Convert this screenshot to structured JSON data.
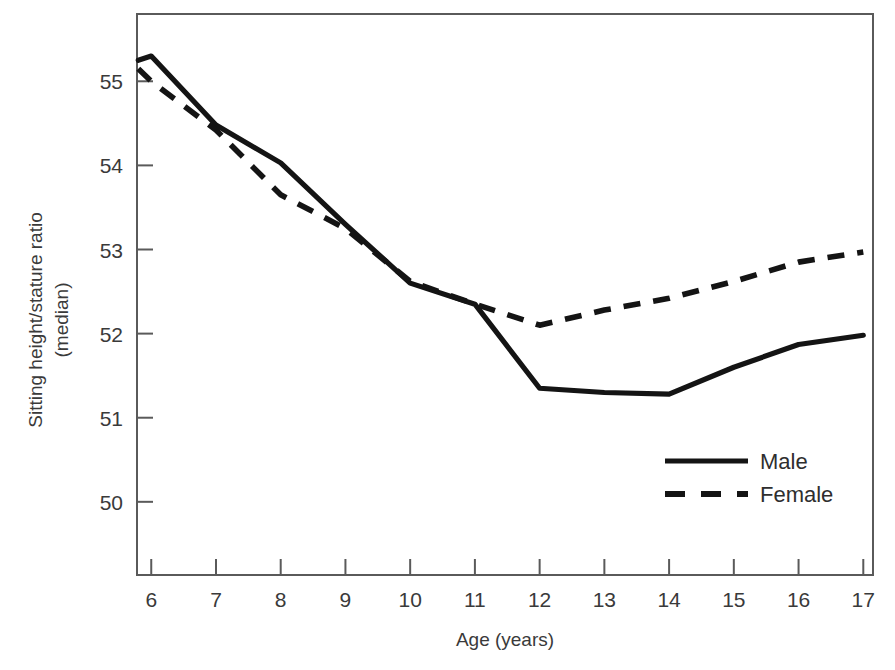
{
  "chart_data": {
    "type": "line",
    "title": "",
    "subtitle": "",
    "xlabel": "Age (years)",
    "ylabel_line1": "Sitting height/stature ratio",
    "ylabel_line2": "(median)",
    "x": [
      6,
      7,
      8,
      9,
      10,
      11,
      12,
      13,
      14,
      15,
      16,
      17
    ],
    "xticklabels": [
      "6",
      "7",
      "8",
      "9",
      "10",
      "11",
      "12",
      "13",
      "14",
      "15",
      "16",
      "17"
    ],
    "yticks": [
      50,
      51,
      52,
      53,
      54,
      55
    ],
    "yticklabels": [
      "50",
      "51",
      "52",
      "53",
      "54",
      "55"
    ],
    "xlim": [
      5.78,
      17.15
    ],
    "ylim": [
      49.13,
      55.8
    ],
    "grid": false,
    "legend_position": "lower right",
    "series": [
      {
        "name": "Male",
        "style": "solid",
        "color": "#141414",
        "x": [
          5.8,
          6.0,
          7.0,
          8.0,
          9.0,
          10.0,
          11.0,
          12.0,
          13.0,
          14.0,
          15.0,
          16.0,
          17.0
        ],
        "values": [
          55.25,
          55.3,
          54.48,
          54.03,
          53.3,
          52.6,
          52.35,
          51.35,
          51.3,
          51.28,
          51.6,
          51.87,
          51.98
        ]
      },
      {
        "name": "Female",
        "style": "dashed",
        "color": "#141414",
        "x": [
          5.8,
          6.0,
          7.0,
          8.0,
          9.0,
          10.0,
          11.0,
          12.0,
          13.0,
          14.0,
          15.0,
          16.0,
          17.0
        ],
        "values": [
          55.15,
          55.0,
          54.42,
          53.65,
          53.25,
          52.62,
          52.35,
          52.1,
          52.28,
          52.42,
          52.62,
          52.85,
          52.97
        ]
      }
    ],
    "legend": [
      {
        "label": "Male",
        "style": "solid"
      },
      {
        "label": "Female",
        "style": "dashed"
      }
    ]
  },
  "colors": {
    "background": "#ffffff",
    "axis": "#5a5a5a",
    "line": "#141414",
    "text": "#3a3a3a"
  }
}
